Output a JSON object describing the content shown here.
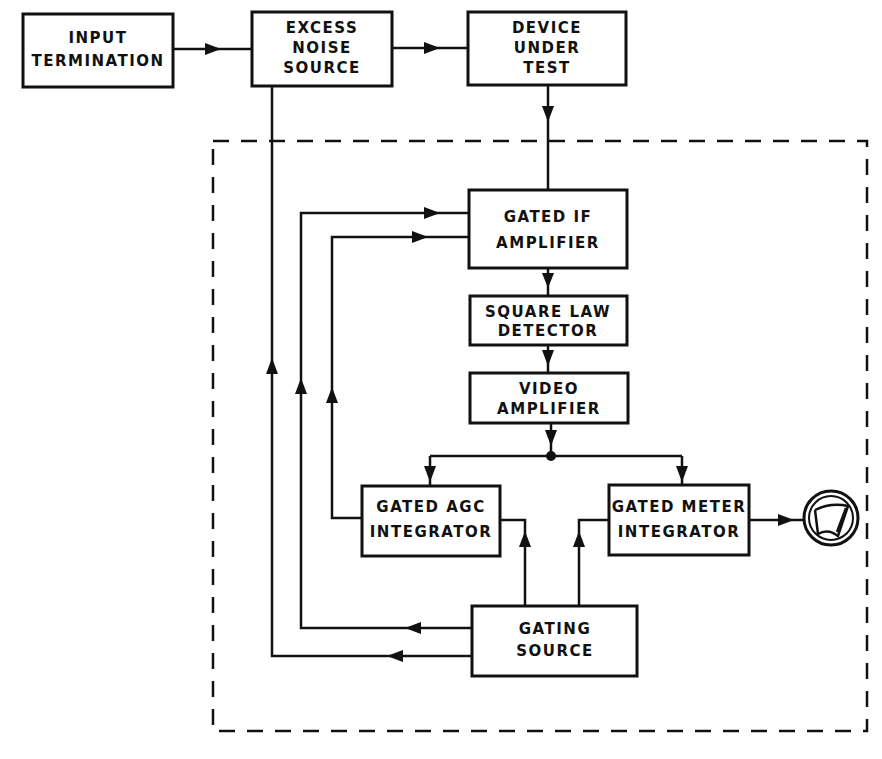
{
  "diagram": {
    "blocks": {
      "input_termination": [
        "INPUT",
        "TERMINATION"
      ],
      "excess_noise_source": [
        "EXCESS",
        "NOISE",
        "SOURCE"
      ],
      "device_under_test": [
        "DEVICE",
        "UNDER",
        "TEST"
      ],
      "gated_if_amplifier": [
        "GATED IF",
        "AMPLIFIER"
      ],
      "square_law_detector": [
        "SQUARE LAW",
        "DETECTOR"
      ],
      "video_amplifier": [
        "VIDEO",
        "AMPLIFIER"
      ],
      "gated_agc_integrator": [
        "GATED AGC",
        "INTEGRATOR"
      ],
      "gated_meter_integrator": [
        "GATED METER",
        "INTEGRATOR"
      ],
      "gating_source": [
        "GATING",
        "SOURCE"
      ]
    },
    "meter_icon": "analog-meter-icon",
    "colors": {
      "ink": "#111111",
      "background": "#ffffff"
    }
  }
}
